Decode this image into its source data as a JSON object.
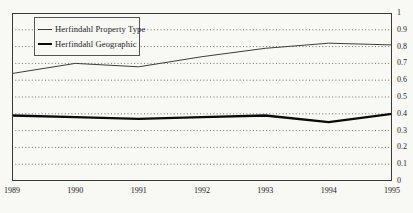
{
  "figure": {
    "background": "#f8f8f5",
    "frame_color": "#3a3a3a"
  },
  "legend": {
    "position": "top-left",
    "entries": [
      {
        "label": "Herfindahl Property Type",
        "line_style": "thin",
        "color": "#3d3d3d"
      },
      {
        "label": "Herfindahl Geographic",
        "line_style": "thick",
        "color": "#0a0a0a"
      }
    ]
  },
  "chart_data": {
    "type": "line",
    "title": "",
    "xlabel": "",
    "ylabel": "",
    "categories": [
      "1989",
      "1990",
      "1991",
      "1992",
      "1993",
      "1994",
      "1995"
    ],
    "series": [
      {
        "name": "Herfindahl Property Type",
        "values": [
          0.64,
          0.7,
          0.68,
          0.74,
          0.79,
          0.82,
          0.81
        ],
        "color": "#3d3d3d",
        "stroke_width": 1
      },
      {
        "name": "Herfindahl Geographic",
        "values": [
          0.39,
          0.38,
          0.37,
          0.38,
          0.39,
          0.35,
          0.4
        ],
        "color": "#0a0a0a",
        "stroke_width": 2.3
      }
    ],
    "ylim": [
      0,
      1
    ],
    "ytick_labels": [
      "0",
      "0.1",
      "0.2",
      "0.3",
      "0.4",
      "0.5",
      "0.6",
      "0.7",
      "0.8",
      "0.9",
      "1"
    ],
    "grid": "horizontal-dotted",
    "y_axis_side": "right",
    "legend_position": "upper-left-inside"
  }
}
